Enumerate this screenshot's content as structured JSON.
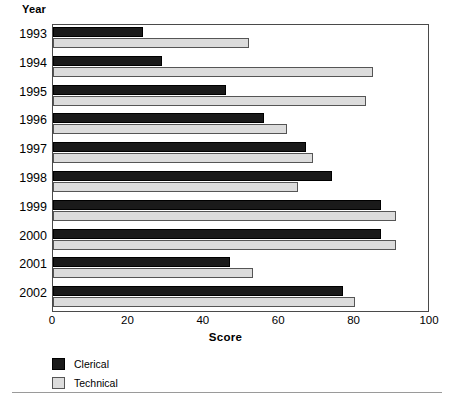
{
  "chart_data": {
    "type": "bar",
    "orientation": "horizontal",
    "title": "",
    "xlabel": "Score",
    "ylabel": "Year",
    "xlim": [
      0,
      100
    ],
    "xticks": [
      0,
      20,
      40,
      60,
      80,
      100
    ],
    "grid": false,
    "legend_position": "bottom-left",
    "categories": [
      "1993",
      "1994",
      "1995",
      "1996",
      "1997",
      "1998",
      "1999",
      "2000",
      "2001",
      "2002"
    ],
    "series": [
      {
        "name": "Clerical",
        "color": "#1a1a1a",
        "values": [
          24,
          29,
          46,
          56,
          67,
          74,
          87,
          87,
          47,
          77
        ]
      },
      {
        "name": "Technical",
        "color": "#dcdcdc",
        "values": [
          52,
          85,
          83,
          62,
          69,
          65,
          91,
          91,
          53,
          80
        ]
      }
    ]
  },
  "legend": {
    "items": [
      {
        "label": "Clerical",
        "swatch": "clerical"
      },
      {
        "label": "Technical",
        "swatch": "technical"
      }
    ]
  },
  "caption": {
    "text": ""
  }
}
